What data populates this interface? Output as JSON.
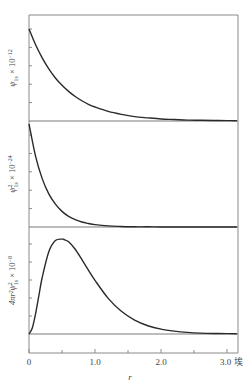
{
  "chart_data": [
    {
      "type": "line",
      "panel": "top",
      "ylabel": "ψ1s × 10⁻¹²",
      "ylabel_main": "ψ",
      "ylabel_sub": "1s",
      "ylabel_scale": " × 10",
      "ylabel_exp": "−12",
      "ylim": [
        0,
        5
      ],
      "yticks": [
        1,
        2,
        3,
        4,
        5
      ],
      "x": [
        0,
        0.1,
        0.2,
        0.3,
        0.4,
        0.5,
        0.6,
        0.7,
        0.8,
        0.9,
        1.0,
        1.2,
        1.4,
        1.6,
        1.8,
        2.0,
        2.2,
        2.4,
        2.6,
        2.8,
        3.0,
        3.15
      ],
      "values": [
        5.0,
        4.14,
        3.43,
        2.83,
        2.34,
        1.94,
        1.61,
        1.33,
        1.1,
        0.91,
        0.76,
        0.52,
        0.36,
        0.24,
        0.17,
        0.11,
        0.08,
        0.05,
        0.04,
        0.03,
        0.02,
        0.01
      ]
    },
    {
      "type": "line",
      "panel": "middle",
      "ylabel": "ψ²1s × 10⁻²⁴",
      "ylabel_main": "ψ",
      "ylabel_sup": "2",
      "ylabel_sub": "1s",
      "ylabel_scale": " × 10",
      "ylabel_exp": "−24",
      "ylim": [
        0,
        5.7
      ],
      "yticks": [
        1,
        2,
        3,
        4,
        5
      ],
      "x": [
        0,
        0.1,
        0.2,
        0.3,
        0.4,
        0.5,
        0.6,
        0.7,
        0.8,
        0.9,
        1.0,
        1.2,
        1.4,
        1.6,
        1.8,
        2.0,
        2.2,
        2.4,
        2.6,
        2.8,
        3.0,
        3.15
      ],
      "values": [
        5.6,
        3.84,
        2.63,
        1.8,
        1.24,
        0.85,
        0.58,
        0.4,
        0.27,
        0.19,
        0.13,
        0.06,
        0.03,
        0.01,
        0.01,
        0.0,
        0.0,
        0.0,
        0.0,
        0.0,
        0.0,
        0.0
      ]
    },
    {
      "type": "line",
      "panel": "bottom",
      "ylabel": "4πr²ψ²1s × 10⁻⁸",
      "ylabel_main": "4πr²ψ",
      "ylabel_sup": "2",
      "ylabel_sub": "1s",
      "ylabel_scale": " × 10",
      "ylabel_exp": "−8",
      "ylim": [
        0,
        5.7
      ],
      "yticks": [
        1,
        2,
        3,
        4,
        5
      ],
      "x": [
        0,
        0.05,
        0.1,
        0.15,
        0.2,
        0.3,
        0.4,
        0.5,
        0.53,
        0.6,
        0.7,
        0.8,
        0.9,
        1.0,
        1.2,
        1.4,
        1.6,
        1.8,
        2.0,
        2.2,
        2.4,
        2.6,
        2.8,
        3.0,
        3.15
      ],
      "values": [
        0,
        0.33,
        1.13,
        2.14,
        3.14,
        4.57,
        5.19,
        5.27,
        5.25,
        5.12,
        4.71,
        4.14,
        3.55,
        2.98,
        1.98,
        1.26,
        0.77,
        0.46,
        0.27,
        0.16,
        0.09,
        0.05,
        0.03,
        0.02,
        0.01
      ]
    }
  ],
  "xaxis": {
    "label": "r",
    "unit": "埃",
    "xlim": [
      0,
      3.15
    ],
    "major_ticks": [
      0,
      1.0,
      2.0,
      3.0
    ],
    "major_labels": [
      "0",
      "1.0",
      "2.0",
      "3.0 埃"
    ],
    "minor_ticks": [
      0.5,
      1.5,
      2.5
    ]
  }
}
